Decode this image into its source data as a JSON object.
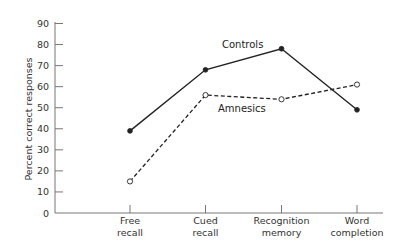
{
  "chart_data": {
    "type": "line",
    "title": "",
    "xlabel": "",
    "ylabel": "Percent correct responses",
    "ylim": [
      0,
      90
    ],
    "yticks": [
      0,
      10,
      20,
      30,
      40,
      50,
      60,
      70,
      80,
      90
    ],
    "categories": [
      [
        "Free",
        "recall"
      ],
      [
        "Cued",
        "recall"
      ],
      [
        "Recognition",
        "memory"
      ],
      [
        "Word",
        "completion"
      ]
    ],
    "category_names": [
      "Free recall",
      "Cued recall",
      "Recognition memory",
      "Word completion"
    ],
    "series": [
      {
        "name": "Controls",
        "style": "solid",
        "marker": "filled-circle",
        "color": "#222222",
        "values": [
          39,
          68,
          78,
          49
        ]
      },
      {
        "name": "Amnesics",
        "style": "dashed",
        "marker": "open-circle",
        "color": "#222222",
        "values": [
          15,
          56,
          54,
          61
        ]
      }
    ],
    "legend": "inline-labels",
    "grid": false
  },
  "labels": {
    "y_axis_title": "Percent correct responses",
    "controls": "Controls",
    "amnesics": "Amnesics"
  }
}
